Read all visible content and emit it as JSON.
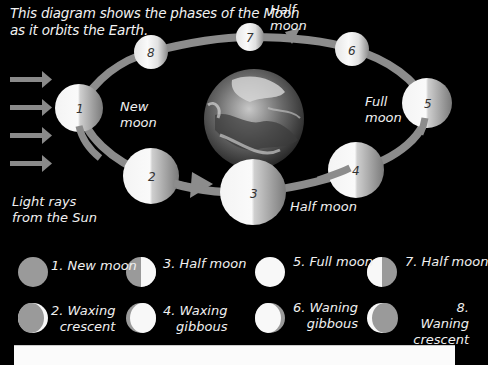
{
  "caption": [
    "This diagram shows the phases of the Moon",
    "as it orbits the Earth."
  ],
  "labels": {
    "new_moon": [
      "New",
      "moon"
    ],
    "half_moon_top": [
      "Half",
      "moon"
    ],
    "full_moon": [
      "Full",
      "moon"
    ],
    "half_moon_bottom": "Half moon",
    "light_rays": [
      "Light rays",
      "from the Sun"
    ]
  },
  "orbit_moons": [
    {
      "number": "1",
      "phase": "New moon"
    },
    {
      "number": "2",
      "phase": "Waxing crescent"
    },
    {
      "number": "3",
      "phase": "Half moon"
    },
    {
      "number": "4",
      "phase": "Waxing gibbous"
    },
    {
      "number": "5",
      "phase": "Full moon"
    },
    {
      "number": "6",
      "phase": "Waning gibbous"
    },
    {
      "number": "7",
      "phase": "Half moon"
    },
    {
      "number": "8",
      "phase": "Waning crescent"
    }
  ],
  "legend": [
    {
      "number": "1.",
      "line1": "New moon",
      "line2": ""
    },
    {
      "number": "2.",
      "line1": "Waxing",
      "line2": "crescent"
    },
    {
      "number": "3.",
      "line1": "Half moon",
      "line2": ""
    },
    {
      "number": "4.",
      "line1": "Waxing",
      "line2": "gibbous"
    },
    {
      "number": "5.",
      "line1": "Full moon",
      "line2": ""
    },
    {
      "number": "6.",
      "line1": "Waning",
      "line2": "gibbous"
    },
    {
      "number": "7.",
      "line1": "Half moon",
      "line2": ""
    },
    {
      "number": "8.",
      "line1": "Waning",
      "line2": "crescent"
    }
  ],
  "colors": {
    "background": "#000000",
    "orbit": "#8c8c8c",
    "arrow": "#8a8a8a",
    "moon_lit": "#f8f8f8",
    "moon_dark": "#9a9a9a",
    "text": "#f0f0f0"
  }
}
